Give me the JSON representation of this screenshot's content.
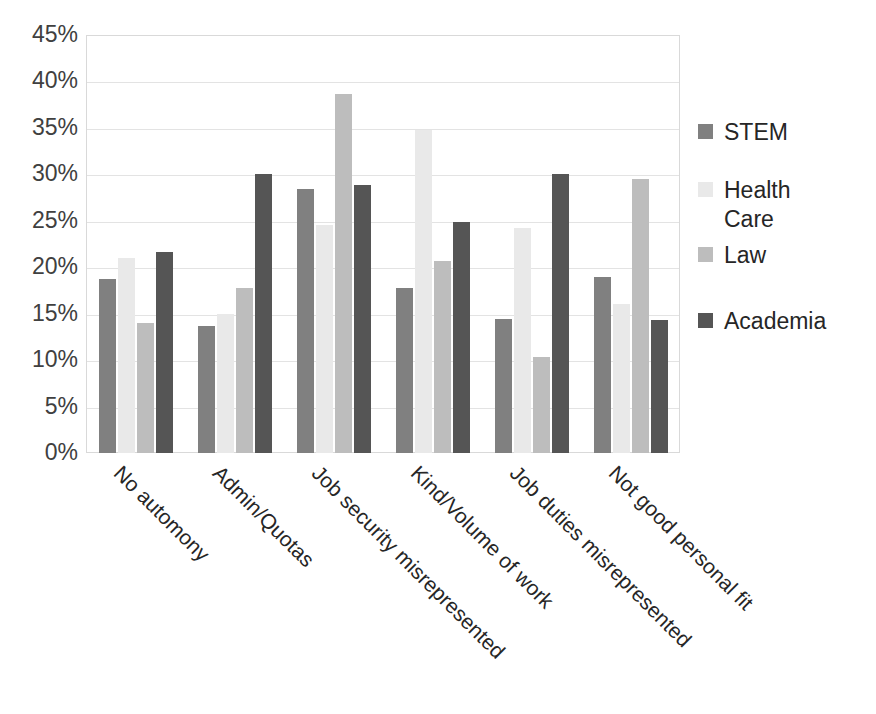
{
  "chart_data": {
    "type": "bar",
    "title": "",
    "subtitle": "",
    "xlabel": "",
    "ylabel": "",
    "ylim": [
      0,
      45
    ],
    "ytick_labels": [
      "45%",
      "40%",
      "35%",
      "30%",
      "25%",
      "20%",
      "15%",
      "10%",
      "5%",
      "0%"
    ],
    "ytick_values": [
      45,
      40,
      35,
      30,
      25,
      20,
      15,
      10,
      5,
      0
    ],
    "grid": true,
    "legend_position": "right",
    "value_suffix": "%",
    "categories": [
      "No automony",
      "Admin/Quotas",
      "Job security misrepresented",
      "Kind/Volume of work",
      "Job duties misrepresented",
      "Not good personal fit"
    ],
    "series": [
      {
        "name": "STEM",
        "color": "#808080",
        "values": [
          18.7,
          13.7,
          28.4,
          17.8,
          14.4,
          19.0
        ]
      },
      {
        "name": "Health Care",
        "color": "#e9e9e9",
        "values": [
          21.0,
          15.0,
          24.5,
          34.8,
          24.2,
          16.0
        ]
      },
      {
        "name": "Law",
        "color": "#bdbdbd",
        "values": [
          14.0,
          17.8,
          38.7,
          20.7,
          10.3,
          29.5
        ]
      },
      {
        "name": "Academia",
        "color": "#555555",
        "values": [
          21.6,
          30.0,
          28.9,
          24.9,
          30.0,
          14.3
        ]
      }
    ]
  },
  "legend": {
    "entries": [
      {
        "label": "STEM",
        "color": "#808080"
      },
      {
        "label": "Health\nCare",
        "color": "#e9e9e9"
      },
      {
        "label": "Law",
        "color": "#bdbdbd"
      },
      {
        "label": "Academia",
        "color": "#555555"
      }
    ]
  }
}
